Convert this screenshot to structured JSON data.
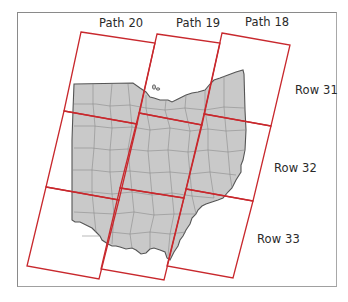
{
  "figure": {
    "colors": {
      "scene_outline": "#c8282d",
      "state_fill": "#c9c9c9",
      "county_lines": "#8c8c8c",
      "state_outline": "#555555",
      "frame_border": "#8a8a8a"
    }
  },
  "paths": [
    {
      "label": "Path 20"
    },
    {
      "label": "Path 19"
    },
    {
      "label": "Path 18"
    }
  ],
  "rows": [
    {
      "label": "Row 31"
    },
    {
      "label": "Row 32"
    },
    {
      "label": "Row 33"
    }
  ]
}
